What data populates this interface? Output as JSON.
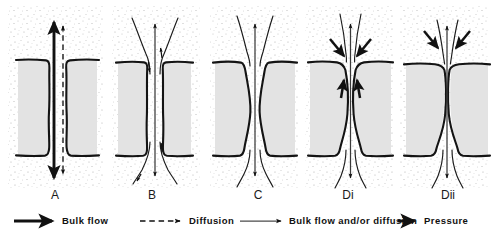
{
  "figure": {
    "type": "diagram",
    "width": 494,
    "height": 236,
    "background_color": "#ffffff",
    "cell_fill_color": "#e3e3e3",
    "cell_outline_color": "#141414",
    "stipple_color": "#b9b9b9",
    "arrow_color": "#111111"
  },
  "panels": [
    {
      "id": "A",
      "label": "A",
      "label_x": 55,
      "label_y": 199,
      "center_x": 57,
      "description": "Straight parallel-sided cleft; thick double-headed bulk-flow arrow and adjacent dashed diffusion arrow, both spanning the full cleft height",
      "cleft_shape": "straight",
      "arrows": [
        "bulk-flow-double-headed",
        "diffusion-dashed-double-headed"
      ],
      "pressure_arrows": 0
    },
    {
      "id": "B",
      "label": "B",
      "label_x": 152,
      "label_y": 199,
      "center_x": 154,
      "description": "Straight narrow cleft with funnel-shaped entrances; thin bulk-flow-and/or-diffusion streamlines curve in from both surfaces, small arrowheads mark inward flow at top and bottom",
      "cleft_shape": "straight-with-funnels",
      "arrows": [
        "bulk-flow-and-or-diffusion-axial",
        "streamlines-converging"
      ],
      "pressure_arrows": 0
    },
    {
      "id": "C",
      "label": "C",
      "label_x": 258,
      "label_y": 199,
      "center_x": 255,
      "description": "Cleft bulged outward into a lens or barrel shape at mid-depth; thin axial arrow plus flared streamlines above and below",
      "cleft_shape": "barrel-bulged",
      "arrows": [
        "bulk-flow-and-or-diffusion-axial",
        "streamlines-flared"
      ],
      "pressure_arrows": 0
    },
    {
      "id": "Di",
      "label": "Di",
      "label_x": 348,
      "label_y": 199,
      "center_x": 350,
      "description": "Cleft constricted to a narrow neck near the luminal surface and widened below; two thick pressure arrows point inward at the neck, two thick pressure arrows point upward inside the cleft",
      "cleft_shape": "necked-top-wide-below",
      "arrows": [
        "bulk-flow-and-or-diffusion-axial",
        "streamlines-converging"
      ],
      "pressure_arrows": 4
    },
    {
      "id": "Dii",
      "label": "Dii",
      "label_x": 448,
      "label_y": 199,
      "center_x": 447,
      "description": "Cleft closed to a very tight neck at the luminal surface with a wide chamber below; two thick pressure arrows angle inward above the neck",
      "cleft_shape": "tight-neck-wide-chamber",
      "arrows": [
        "bulk-flow-and-or-diffusion-axial",
        "streamlines-converging"
      ],
      "pressure_arrows": 2
    }
  ],
  "legend": {
    "items": [
      {
        "key": "bulk-flow",
        "label": "Bulk flow",
        "arrow_style": "thick-solid",
        "text_x": 62,
        "text_y": 221,
        "line_x1": 14,
        "line_x2": 52,
        "line_y": 221
      },
      {
        "key": "diffusion",
        "label": "Diffusion",
        "arrow_style": "dashed",
        "text_x": 189,
        "text_y": 221,
        "line_x1": 140,
        "line_x2": 180,
        "line_y": 221
      },
      {
        "key": "bulk-flow-and-or-diffusion",
        "label": "Bulk flow and/or diffusion",
        "arrow_style": "thin-solid",
        "text_x": 289,
        "text_y": 221,
        "line_x1": 240,
        "line_x2": 281,
        "line_y": 221
      },
      {
        "key": "pressure",
        "label": "Pressure",
        "arrow_style": "thick-stub",
        "text_x": 424,
        "text_y": 221,
        "line_x1": 398,
        "line_x2": 416,
        "line_y": 221
      }
    ]
  }
}
